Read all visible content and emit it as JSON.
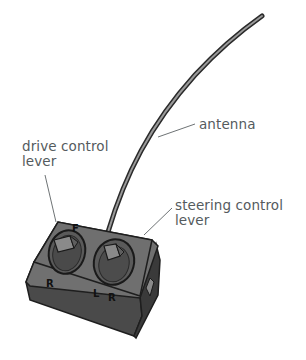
{
  "diagram": {
    "labels": {
      "antenna": "antenna",
      "drive_lever_line1": "drive control",
      "drive_lever_line2": "lever",
      "steering_lever_line1": "steering control",
      "steering_lever_line2": "lever"
    },
    "box_markings": {
      "drive_forward": "F",
      "drive_reverse": "R",
      "steer_left": "L",
      "steer_right": "R"
    },
    "colors": {
      "background": "#ffffff",
      "label_text": "#555b5e",
      "leader_line": "#6e7375",
      "box_top": "#6f6f6f",
      "box_front": "#4a4a4a",
      "box_side": "#3a3a3a",
      "outline": "#1e1e1e"
    }
  }
}
